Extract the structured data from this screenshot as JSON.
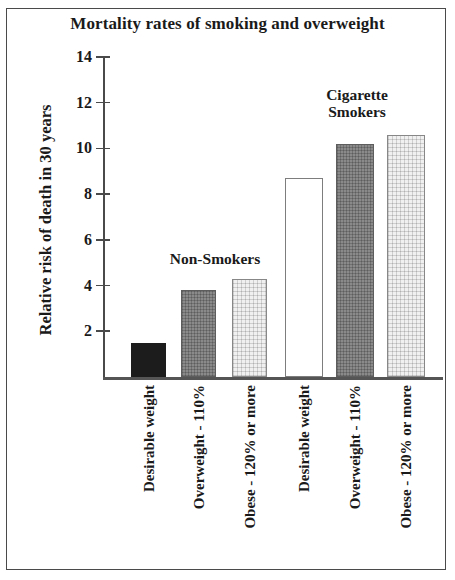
{
  "chart_data": {
    "type": "bar",
    "title": "Mortality rates of smoking and overweight",
    "xlabel": "",
    "ylabel": "Relative risk of death in 30 years",
    "ylim": [
      0,
      14
    ],
    "yticks": [
      2,
      4,
      6,
      8,
      10,
      12,
      14
    ],
    "ytick_labels": [
      "2",
      "4",
      "6",
      "8",
      "10",
      "12",
      "14"
    ],
    "grid": false,
    "legend_position": "none",
    "categories": [
      "Desirable weight",
      "Overweight - 110%",
      "Obese - 120% or more",
      "Desirable weight",
      "Overweight - 110%",
      "Obese - 120% or more"
    ],
    "values": [
      1.5,
      3.8,
      4.3,
      8.7,
      10.2,
      10.6
    ],
    "bar_fills": [
      "black",
      "dark",
      "light",
      "white",
      "dark",
      "light"
    ],
    "groups": [
      {
        "name": "Non-Smokers",
        "bar_indices": [
          0,
          1,
          2
        ]
      },
      {
        "name": "Cigarette Smokers",
        "bar_indices": [
          3,
          4,
          5
        ]
      }
    ],
    "annotations": [
      {
        "text": "Non-Smokers"
      },
      {
        "text": "Cigarette\nSmokers"
      }
    ]
  },
  "axis": {
    "y_title": "Relative risk of death in 30 years",
    "ticks": [
      {
        "value": 14,
        "label": "14"
      },
      {
        "value": 12,
        "label": "12"
      },
      {
        "value": 10,
        "label": "10"
      },
      {
        "value": 8,
        "label": "8"
      },
      {
        "value": 6,
        "label": "6"
      },
      {
        "value": 4,
        "label": "4"
      },
      {
        "value": 2,
        "label": "2"
      }
    ]
  },
  "colors": {
    "ink": "#1a1a1a",
    "axis": "#4a4a4a",
    "bar_black": "#1c1c1c",
    "bar_dark": "#8a8a8a",
    "bar_light": "#f0f0f0",
    "bar_white": "#ffffff",
    "frame": "#4a4a4a"
  }
}
